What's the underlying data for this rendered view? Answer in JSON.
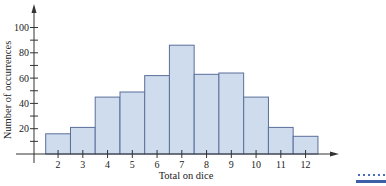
{
  "chart_data": {
    "type": "bar",
    "title": "",
    "xlabel": "Total on dice",
    "ylabel": "Number of occurrences",
    "categories": [
      "2",
      "3",
      "4",
      "5",
      "6",
      "7",
      "8",
      "9",
      "10",
      "11",
      "12"
    ],
    "values": [
      16,
      21,
      45,
      49,
      62,
      86,
      63,
      64,
      45,
      21,
      14
    ],
    "ylim": [
      0,
      110
    ],
    "yticks_labeled": [
      20,
      40,
      60,
      80,
      100
    ],
    "yticks_minor_step": 10,
    "grid": false,
    "legend": null,
    "bar_fill": "#cfdcee",
    "bar_stroke": "#5a6f9a"
  }
}
